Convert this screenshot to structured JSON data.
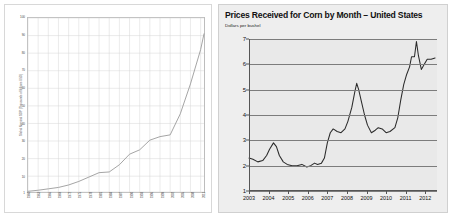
{
  "left_chart": {
    "ylabel": "Global Nominal GDP (Thousands of Billions USD)",
    "yticks": [
      "100",
      "90",
      "80",
      "70",
      "60",
      "50",
      "40",
      "30",
      "20",
      "10",
      "1"
    ],
    "xticks": [
      "1960",
      "1963",
      "1966",
      "1969",
      "1972",
      "1975",
      "1978",
      "1981",
      "1984",
      "1987",
      "1990",
      "1993",
      "1996",
      "1999",
      "2002",
      "2005",
      "2008",
      "2011"
    ]
  },
  "right_chart": {
    "title": "Prices Received for Corn by Month – United States",
    "subtitle": "Dollars per bushel"
  },
  "chart_data": [
    {
      "type": "line",
      "title": "",
      "xlabel": "",
      "ylabel": "Global Nominal GDP (Thousands of Billions USD)",
      "ylim": [
        1,
        100
      ],
      "xlim": [
        1960,
        2012
      ],
      "grid": true,
      "legend": "none",
      "x": [
        1960,
        1963,
        1966,
        1969,
        1972,
        1975,
        1978,
        1981,
        1984,
        1987,
        1990,
        1993,
        1996,
        1999,
        2002,
        2005,
        2008,
        2011,
        2012
      ],
      "values": [
        1.4,
        2.0,
        2.8,
        3.6,
        5.0,
        7.0,
        9.5,
        12.0,
        12.4,
        16.5,
        22.5,
        25.0,
        30.5,
        32.5,
        33.5,
        45.5,
        62.5,
        82.0,
        91.0
      ]
    },
    {
      "type": "line",
      "title": "Prices Received for Corn by Month – United States",
      "xlabel": "",
      "ylabel": "Dollars per bushel",
      "ylim": [
        1,
        7
      ],
      "xlim": [
        2003,
        2012.6
      ],
      "grid": true,
      "legend": "none",
      "tick_labels": [
        "2003",
        "2004",
        "2005",
        "2006",
        "2007",
        "2008",
        "2009",
        "2010",
        "2011",
        "2012"
      ],
      "x": [
        2003.0,
        2003.2,
        2003.45,
        2003.7,
        2003.9,
        2004.05,
        2004.25,
        2004.4,
        2004.55,
        2004.75,
        2004.95,
        2005.2,
        2005.45,
        2005.7,
        2005.95,
        2006.15,
        2006.35,
        2006.5,
        2006.7,
        2006.85,
        2007.0,
        2007.15,
        2007.3,
        2007.5,
        2007.7,
        2007.9,
        2008.05,
        2008.25,
        2008.4,
        2008.5,
        2008.6,
        2008.75,
        2008.9,
        2009.05,
        2009.25,
        2009.45,
        2009.6,
        2009.8,
        2010.0,
        2010.2,
        2010.45,
        2010.6,
        2010.75,
        2010.9,
        2011.05,
        2011.2,
        2011.3,
        2011.45,
        2011.55,
        2011.65,
        2011.8,
        2011.95,
        2012.1,
        2012.3,
        2012.5
      ],
      "values": [
        2.3,
        2.25,
        2.15,
        2.2,
        2.4,
        2.65,
        2.9,
        2.75,
        2.4,
        2.15,
        2.05,
        2.0,
        2.0,
        2.05,
        1.95,
        2.0,
        2.1,
        2.05,
        2.1,
        2.3,
        2.9,
        3.3,
        3.45,
        3.35,
        3.3,
        3.45,
        3.75,
        4.3,
        4.9,
        5.25,
        5.0,
        4.5,
        4.0,
        3.6,
        3.3,
        3.4,
        3.5,
        3.45,
        3.3,
        3.35,
        3.5,
        3.9,
        4.6,
        5.2,
        5.6,
        5.9,
        6.3,
        6.3,
        6.9,
        6.35,
        5.8,
        6.0,
        6.2,
        6.2,
        6.25
      ]
    }
  ]
}
